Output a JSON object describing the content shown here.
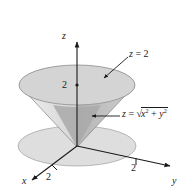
{
  "figure": {
    "type": "3d-surface-diagram",
    "background_color": "#ffffff",
    "ink_color": "#1a1a1a"
  },
  "axes": {
    "z": {
      "name": "z",
      "tick_label": "2",
      "direction": "up"
    },
    "y": {
      "name": "y",
      "tick_label": "2",
      "direction": "right"
    },
    "x": {
      "name": "x",
      "tick_label": "2",
      "direction": "down-left"
    }
  },
  "labels": {
    "plane": {
      "text": "z = 2",
      "lhs": "z",
      "eq": " = ",
      "rhs": "2"
    },
    "cone": {
      "text": "z = sqrt(x^2 + y^2)",
      "lhs": "z",
      "eq": " = ",
      "radical": "√",
      "x_var": "x",
      "x_exp": "2",
      "plus": " + ",
      "y_var": "y",
      "y_exp": "2"
    }
  },
  "surfaces": {
    "top_disk": {
      "name": "plane-z-equals-2-disk",
      "fill": "#d4d4d4",
      "stroke": "#8a8a8a"
    },
    "cone_left": {
      "name": "cone-lateral-left",
      "fill": "#e6e6e6"
    },
    "cone_right": {
      "name": "cone-lateral-right",
      "fill": "#c3c3c3"
    },
    "cone_interior": {
      "name": "cone-interior-shadow",
      "fill": "#aaaaaa"
    },
    "ground_disk": {
      "name": "xy-plane-disk",
      "fill": "#dedede",
      "stroke": "#9a9a9a"
    }
  }
}
